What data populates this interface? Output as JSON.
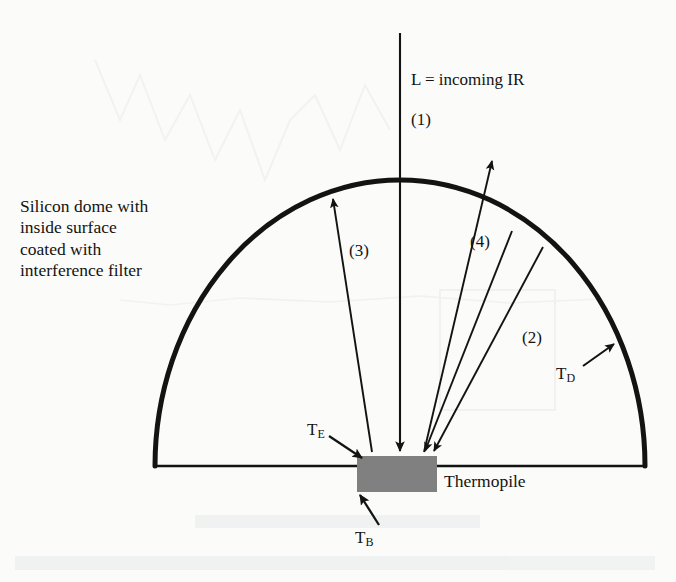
{
  "figure": {
    "type": "schematic-diagram",
    "background_color": "#fbfbf9",
    "ink_color": "#131313",
    "thermopile_fill": "#808080"
  },
  "labels": {
    "dome_caption": "Silicon dome with\ninside surface\ncoated with\ninterference filter",
    "incoming_ir": "L = incoming IR",
    "ray1": "(1)",
    "ray2": "(2)",
    "ray3": "(3)",
    "ray4": "(4)",
    "thermopile": "Thermopile",
    "temp_dome": "T",
    "temp_dome_sub": "D",
    "temp_element": "T",
    "temp_element_sub": "E",
    "temp_body": "T",
    "temp_body_sub": "B"
  },
  "geometry": {
    "dome": {
      "center_x": 400,
      "base_y": 466,
      "radius_x": 245,
      "radius_y": 286,
      "stroke_width": 5
    },
    "base_line": {
      "x1": 155,
      "x2": 644,
      "y": 466,
      "stroke_width": 2.5
    },
    "thermopile_rect": {
      "x": 357,
      "y": 456,
      "width": 80,
      "height": 36
    },
    "rays": [
      {
        "name": "ray1-incoming-ir",
        "x1": 400,
        "y1": 33,
        "x2": 400,
        "y2": 452,
        "arrow": "end"
      },
      {
        "name": "ray2-dome-emission",
        "x1": 542,
        "y1": 246,
        "x2": 432,
        "y2": 452,
        "arrow": "end"
      },
      {
        "name": "ray3-upward-emission",
        "x1": 372,
        "y1": 452,
        "x2": 332,
        "y2": 197,
        "arrow": "end"
      },
      {
        "name": "ray4-transmitted",
        "x1": 424,
        "y1": 452,
        "x2": 492,
        "y2": 160,
        "arrow": "end"
      },
      {
        "name": "ray4b-return",
        "x1": 512,
        "y1": 230,
        "x2": 424,
        "y2": 452,
        "arrow": "end"
      }
    ],
    "pointers": [
      {
        "name": "td-pointer",
        "x1": 584,
        "y1": 364,
        "x2": 613,
        "y2": 344
      },
      {
        "name": "te-pointer",
        "x1": 330,
        "y1": 437,
        "x2": 362,
        "y2": 458
      },
      {
        "name": "tb-pointer",
        "x1": 378,
        "y1": 524,
        "x2": 360,
        "y2": 494
      }
    ]
  }
}
